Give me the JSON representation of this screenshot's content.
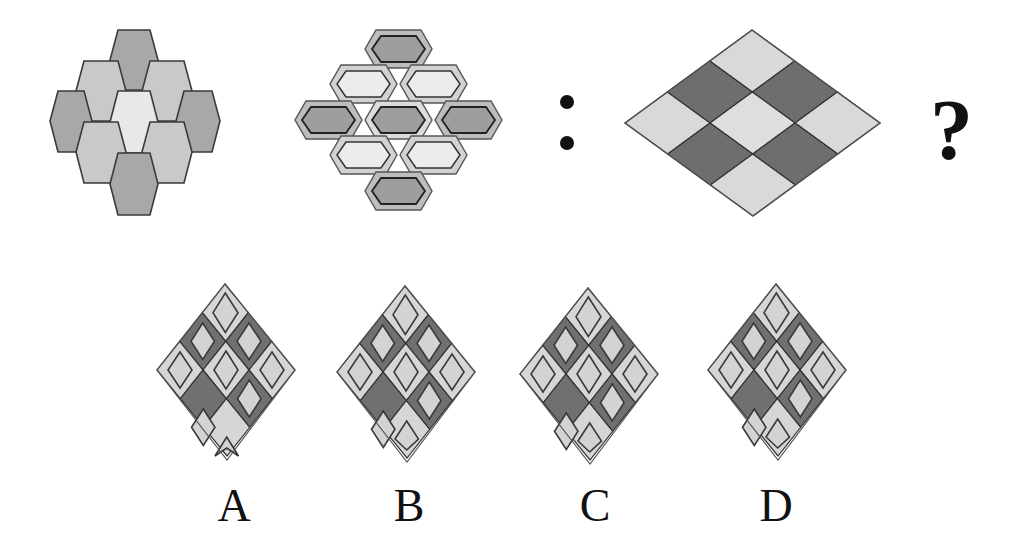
{
  "puzzle": {
    "question_mark": "?",
    "colon_separator": ":",
    "colors": {
      "dark_gray": "#6e6e6e",
      "mid_gray": "#a9a9a9",
      "light_gray": "#d4d4d4",
      "very_light": "#ececec",
      "outline": "#333333"
    }
  },
  "figures": [
    {
      "id": "hex-cluster-plain",
      "description": "9 hexagons; center light, 4 corners dark, 4 sides medium"
    },
    {
      "id": "hex-cluster-bordered",
      "description": "9 bordered hexagons; center and corners dark inner, sides light inner"
    },
    {
      "id": "rhombus-grid",
      "description": "3x3 rhombus grid; 4 dark cells around light center"
    }
  ],
  "options": [
    {
      "label": "A"
    },
    {
      "label": "B"
    },
    {
      "label": "C"
    },
    {
      "label": "D"
    }
  ]
}
